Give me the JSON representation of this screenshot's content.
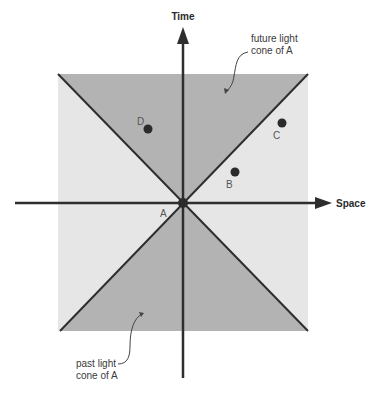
{
  "diagram": {
    "axes": {
      "time_label": "Time",
      "space_label": "Space"
    },
    "origin": {
      "label": "A"
    },
    "events": [
      {
        "label": "D",
        "region": "future light cone"
      },
      {
        "label": "C",
        "region": "elsewhere"
      },
      {
        "label": "B",
        "region": "elsewhere"
      }
    ],
    "annotations": {
      "future_line1": "future light",
      "future_line2": "cone of A",
      "past_line1": "past light",
      "past_line2": "cone of A"
    },
    "colors": {
      "cone_fill": "#b3b3b3",
      "elsewhere_fill": "#e6e6e6",
      "axis": "#2e2e2e",
      "point": "#2b2b2b"
    }
  }
}
